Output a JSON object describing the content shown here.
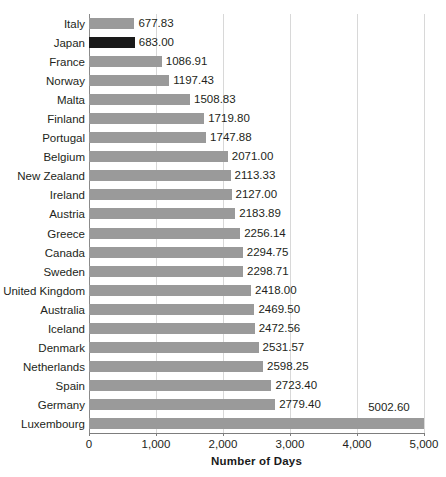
{
  "chart_data": {
    "type": "bar",
    "orientation": "horizontal",
    "title": "",
    "xlabel": "Number of Days",
    "ylabel": "",
    "xlim": [
      0,
      5000
    ],
    "xticks": [
      "0",
      "1,000",
      "2,000",
      "3,000",
      "4,000",
      "5,000"
    ],
    "xtick_values": [
      0,
      1000,
      2000,
      3000,
      4000,
      5000
    ],
    "grid": true,
    "grid_axis": "x",
    "legend": false,
    "categories": [
      "Italy",
      "Japan",
      "France",
      "Norway",
      "Malta",
      "Finland",
      "Portugal",
      "Belgium",
      "New Zealand",
      "Ireland",
      "Austria",
      "Greece",
      "Canada",
      "Sweden",
      "United Kingdom",
      "Australia",
      "Iceland",
      "Denmark",
      "Netherlands",
      "Spain",
      "Germany",
      "Luxembourg"
    ],
    "values": [
      677.83,
      683.0,
      1086.91,
      1197.43,
      1508.83,
      1719.8,
      1747.88,
      2071.0,
      2113.33,
      2127.0,
      2183.89,
      2256.14,
      2294.75,
      2298.71,
      2418.0,
      2469.5,
      2472.56,
      2531.57,
      2598.25,
      2723.4,
      2779.4,
      5002.6
    ],
    "value_labels": [
      "677.83",
      "683.00",
      "1086.91",
      "1197.43",
      "1508.83",
      "1719.80",
      "1747.88",
      "2071.00",
      "2113.33",
      "2127.00",
      "2183.89",
      "2256.14",
      "2294.75",
      "2298.71",
      "2418.00",
      "2469.50",
      "2472.56",
      "2531.57",
      "2598.25",
      "2723.40",
      "2779.40",
      "5002.60"
    ],
    "highlighted_category": "Japan",
    "colors": {
      "bar": "#9a9a9a",
      "bar_highlight": "#1a1a1a",
      "gridline": "#d8d8d8",
      "axis": "#7d7d7d",
      "text": "#231f20",
      "background": "#ffffff"
    },
    "label_placement": {
      "Luxembourg": "above-bar-right",
      "default": "right-of-bar"
    }
  }
}
